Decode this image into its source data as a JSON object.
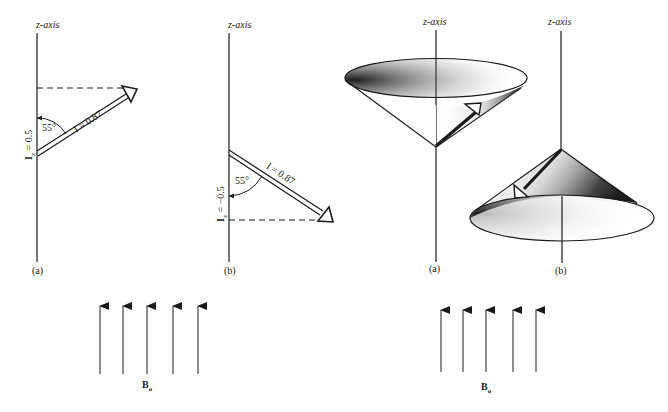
{
  "figure": {
    "vector_diagrams": [
      {
        "id": "vector-a",
        "axis_label": "z-axis",
        "panel_label": "(a)",
        "angle_label": "55°",
        "magnitude_label": "I = 0.87",
        "projection_label": "I_z = 0.5",
        "projection_main": "I",
        "projection_sub": "z",
        "projection_value": " = 0.5"
      },
      {
        "id": "vector-b",
        "axis_label": "z-axis",
        "panel_label": "(b)",
        "angle_label": "55°",
        "magnitude_label": "I = 0.87",
        "projection_label": "I_z = −0.5",
        "projection_main": "I",
        "projection_sub": "z",
        "projection_value": " = −0.5"
      }
    ],
    "cone_diagrams": [
      {
        "id": "cone-a",
        "axis_label": "z-axis",
        "panel_label": "(a)",
        "orientation": "opening upward"
      },
      {
        "id": "cone-b",
        "axis_label": "z-axis",
        "panel_label": "(b)",
        "orientation": "opening downward"
      }
    ],
    "field_groups": [
      {
        "id": "field-left",
        "label_main": "B",
        "label_sub": "o",
        "arrow_count": 5
      },
      {
        "id": "field-right",
        "label_main": "B",
        "label_sub": "o",
        "arrow_count": 5
      }
    ],
    "colors": {
      "ink": "#1a1a1a",
      "paper": "#ffffff",
      "stipple": "#333333"
    }
  }
}
